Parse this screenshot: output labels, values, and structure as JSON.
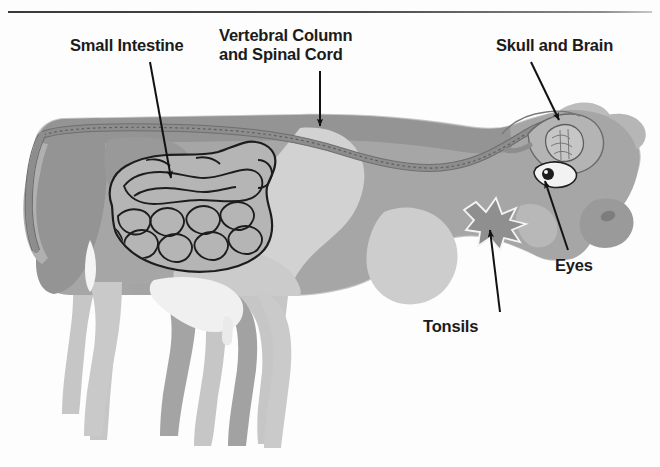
{
  "page": {
    "background_color": "#fdfdfd",
    "width": 660,
    "height": 467
  },
  "top_rule": {
    "name": "horizontal-divider",
    "color": "#3a3a3a"
  },
  "cut_off_heading": {
    "text": "",
    "note": "faint partially cropped text row above the divider"
  },
  "labels": [
    {
      "id": "small-intestine",
      "text": "Small Intestine",
      "lines": [
        "Small Intestine"
      ],
      "x": 70,
      "y": 36,
      "leader": {
        "from": [
          150,
          60
        ],
        "to": [
          172,
          180
        ]
      }
    },
    {
      "id": "vertebral-column",
      "text": "Vertebral Column and Spinal Cord",
      "lines": [
        "Vertebral Column",
        "and Spinal Cord"
      ],
      "x": 219,
      "y": 26,
      "leader": {
        "from": [
          320,
          70
        ],
        "to": [
          320,
          130
        ]
      }
    },
    {
      "id": "skull-and-brain",
      "text": "Skull and Brain",
      "lines": [
        "Skull and Brain"
      ],
      "x": 496,
      "y": 36,
      "leader": {
        "from": [
          534,
          62
        ],
        "to": [
          560,
          120
        ]
      }
    },
    {
      "id": "eyes",
      "text": "Eyes",
      "lines": [
        "Eyes"
      ],
      "x": 555,
      "y": 256,
      "leader": {
        "from": [
          556,
          250
        ],
        "to": [
          548,
          173
        ]
      }
    },
    {
      "id": "tonsils",
      "text": "Tonsils",
      "lines": [
        "Tonsils"
      ],
      "x": 423,
      "y": 317,
      "leader": {
        "from": [
          498,
          310
        ],
        "to": [
          489,
          228
        ]
      }
    }
  ],
  "illustration": {
    "name": "cow-side-view",
    "subject": "cow",
    "orientation": "facing-right",
    "style": "grayscale flat illustration",
    "palette": {
      "body_mid_gray": "#a6a6a6",
      "body_dark_gray": "#949494",
      "body_light_gray": "#c4c4c4",
      "body_pale_gray": "#d9d9d9",
      "udder_white": "#f0f0f0",
      "outline_black": "#202020",
      "spine_gray": "#8e8e8e",
      "organ_fill": "#b2b2b2",
      "eye_white": "#f2f2f2"
    },
    "organs": [
      {
        "id": "small-intestine",
        "label": "Small Intestine",
        "description": "coiled intestinal mass in the abdomen"
      },
      {
        "id": "vertebral-column",
        "label": "Vertebral Column and Spinal Cord",
        "description": "band running from tail along the back to the skull"
      },
      {
        "id": "skull-brain",
        "label": "Skull and Brain",
        "description": "brain outline inside the head"
      },
      {
        "id": "eye",
        "label": "Eyes",
        "description": "eye with pupil on the head"
      },
      {
        "id": "tonsils",
        "label": "Tonsils",
        "description": "star-shaped patch at the throat"
      }
    ]
  }
}
